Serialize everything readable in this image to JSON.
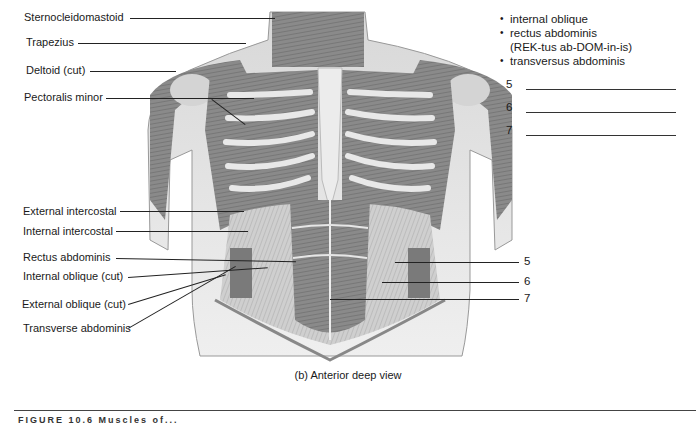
{
  "figure": {
    "view_caption": "(b) Anterior deep view",
    "figure_label_partial": "FIGURE 10.6  Muscles of..."
  },
  "left_labels": [
    {
      "text": "Sternocleidomastoid"
    },
    {
      "text": "Trapezius"
    },
    {
      "text": "Deltoid (cut)"
    },
    {
      "text": "Pectoralis minor"
    },
    {
      "text": "External intercostal"
    },
    {
      "text": "Internal intercostal"
    },
    {
      "text": "Rectus abdominis"
    },
    {
      "text": "Internal oblique (cut)"
    },
    {
      "text": "External oblique (cut)"
    },
    {
      "text": "Transverse abdominis"
    }
  ],
  "right_labels": [
    {
      "number": "5"
    },
    {
      "number": "6"
    },
    {
      "number": "7"
    }
  ],
  "word_bank": {
    "items": [
      "internal oblique",
      "rectus abdominis",
      "transversus abdominis"
    ],
    "pronunciation": "(REK-tus ab-DOM-in-is)"
  },
  "answer_blanks": [
    {
      "number": "5",
      "value": ""
    },
    {
      "number": "6",
      "value": ""
    },
    {
      "number": "7",
      "value": ""
    }
  ]
}
